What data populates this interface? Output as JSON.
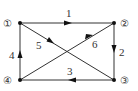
{
  "diagram": {
    "type": "directed-graph",
    "nodes": [
      {
        "id": "1",
        "label": "①",
        "x": 20,
        "y": 23
      },
      {
        "id": "2",
        "label": "②",
        "x": 114,
        "y": 23
      },
      {
        "id": "3",
        "label": "③",
        "x": 114,
        "y": 80
      },
      {
        "id": "4",
        "label": "④",
        "x": 20,
        "y": 80
      }
    ],
    "edges": [
      {
        "label": "1",
        "from": "1",
        "to": "2"
      },
      {
        "label": "2",
        "from": "2",
        "to": "3"
      },
      {
        "label": "3",
        "from": "3",
        "to": "4"
      },
      {
        "label": "4",
        "from": "4",
        "to": "1"
      },
      {
        "label": "5",
        "from": "1",
        "to": "3"
      },
      {
        "label": "6",
        "from": "4",
        "to": "2"
      }
    ]
  },
  "colors": {
    "line": "#333333",
    "node": "#111111",
    "background": "#ffffff"
  }
}
